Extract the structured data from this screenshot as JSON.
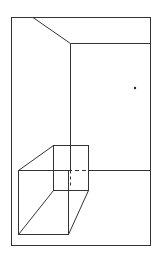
{
  "diagram": {
    "title": "",
    "stroke_color": "#333333",
    "background": "#ffffff"
  }
}
